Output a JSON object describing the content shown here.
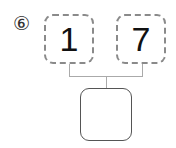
{
  "problem": {
    "number_label": "⑥",
    "top_boxes": [
      {
        "value": "1"
      },
      {
        "value": "7"
      }
    ],
    "bottom_box": {
      "value": ""
    }
  }
}
